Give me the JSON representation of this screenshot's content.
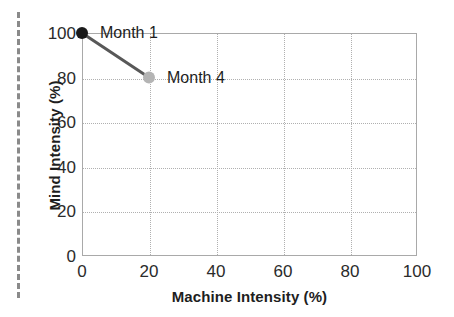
{
  "chart_data": {
    "type": "line",
    "title": "",
    "xlabel": "Machine Intensity (%)",
    "ylabel": "Mind Intensity (%)",
    "xlim": [
      0,
      100
    ],
    "ylim": [
      0,
      100
    ],
    "xticks": [
      "0",
      "20",
      "40",
      "60",
      "80",
      "100"
    ],
    "yticks": [
      "0",
      "20",
      "40",
      "60",
      "80",
      "100"
    ],
    "grid": "dotted",
    "legend": "none",
    "series": [
      {
        "name": "therapy trajectory",
        "x": [
          0,
          20
        ],
        "y": [
          100,
          80
        ],
        "line_color": "#585858",
        "points": [
          {
            "label": "Month 1",
            "x": 0,
            "y": 100,
            "marker_color": "#1a1a1a"
          },
          {
            "label": "Month 4",
            "x": 20,
            "y": 80,
            "marker_color": "#b4b4b4"
          }
        ]
      }
    ],
    "annotations": [
      {
        "text": "Month 1",
        "x": 0,
        "y": 100
      },
      {
        "text": "Month 4",
        "x": 20,
        "y": 80
      }
    ]
  },
  "decorations": {
    "page_edge_rule": "vertical-dashed-rule"
  }
}
